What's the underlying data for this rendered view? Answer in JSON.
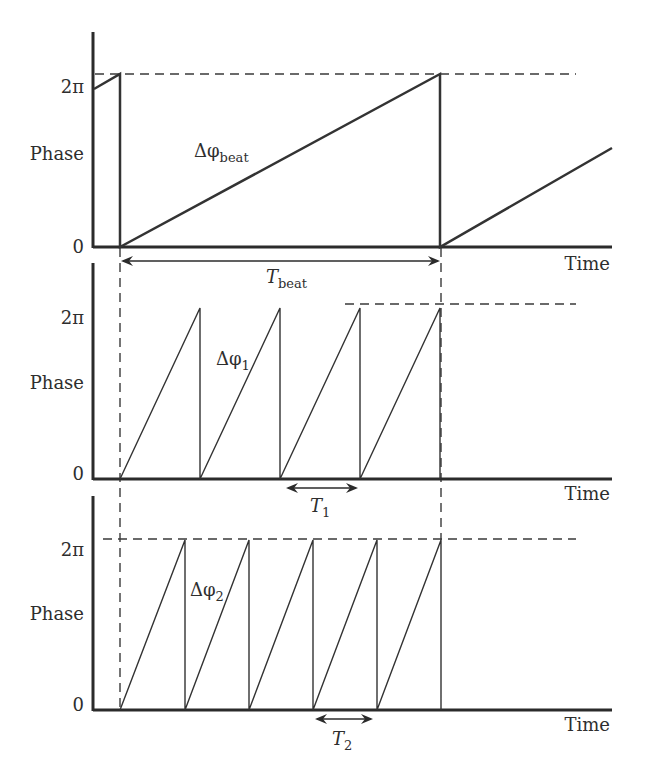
{
  "diagram": {
    "axis_labels": {
      "y_label": "Phase",
      "x_label": "Time",
      "y_top": "2π",
      "y_bottom": "0"
    },
    "panels": [
      {
        "id": "beat",
        "curve_label": "Δφ",
        "curve_sub": "beat",
        "period_label": "T",
        "period_sub": "beat",
        "ramp_count": 2
      },
      {
        "id": "signal1",
        "curve_label": "Δφ",
        "curve_sub": "1",
        "period_label": "T",
        "period_sub": "1",
        "ramp_count": 4
      },
      {
        "id": "signal2",
        "curve_label": "Δφ",
        "curve_sub": "2",
        "period_label": "T",
        "period_sub": "2",
        "ramp_count": 5
      }
    ],
    "colors": {
      "line": "#2b2b2b",
      "background": "#ffffff"
    }
  }
}
